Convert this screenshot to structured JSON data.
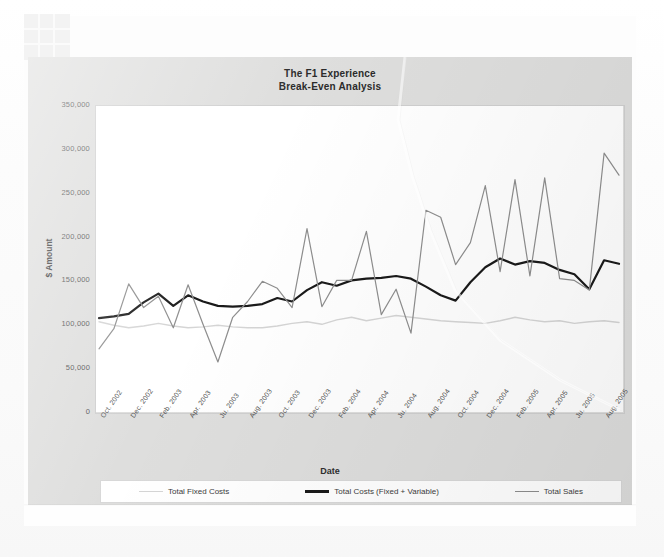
{
  "document": {
    "grid_icon": "spreadsheet-grid-icon"
  },
  "chart": {
    "title_line1": "The F1 Experience",
    "title_line2": "Break-Even Analysis",
    "xlabel": "Date",
    "ylabel": "$ Amount",
    "legend": [
      {
        "label": "Total Fixed Costs",
        "color": "#d5d5d5",
        "width": 1.4
      },
      {
        "label": "Total Costs (Fixed + Variable)",
        "color": "#1a1a1a",
        "width": 2.2
      },
      {
        "label": "Total Sales",
        "color": "#8e8e8e",
        "width": 1.2
      }
    ]
  },
  "chart_data": {
    "type": "line",
    "title": "The F1 Experience Break-Even Analysis",
    "xlabel": "Date",
    "ylabel": "$ Amount",
    "ylim": [
      0,
      350000
    ],
    "yticks": [
      "0",
      "50,000",
      "100,000",
      "150,000",
      "200,000",
      "250,000",
      "300,000",
      "350,000"
    ],
    "ytick_values": [
      0,
      50000,
      100000,
      150000,
      200000,
      250000,
      300000,
      350000
    ],
    "grid": false,
    "legend_position": "bottom",
    "tick_labels": [
      "Oct. 2002",
      "Dec. 2002",
      "Feb. 2003",
      "Apr. 2003",
      "Ju. 2003",
      "Aug. 2003",
      "Oct. 2003",
      "Dec. 2003",
      "Feb. 2004",
      "Apr. 2004",
      "Ju. 2004",
      "Aug. 2004",
      "Oct. 2004",
      "Dec. 2004",
      "Feb. 2005",
      "Apr. 2005",
      "Ju. 2005",
      "Aug. 2005"
    ],
    "x": [
      "Oct. 2002",
      "Nov. 2002",
      "Dec. 2002",
      "Jan. 2003",
      "Feb. 2003",
      "Mar. 2003",
      "Apr. 2003",
      "May 2003",
      "Ju. 2003",
      "Jul. 2003",
      "Aug. 2003",
      "Sep. 2003",
      "Oct. 2003",
      "Nov. 2003",
      "Dec. 2003",
      "Jan. 2004",
      "Feb. 2004",
      "Mar. 2004",
      "Apr. 2004",
      "May 2004",
      "Ju. 2004",
      "Jul. 2004",
      "Aug. 2004",
      "Sep. 2004",
      "Oct. 2004",
      "Nov. 2004",
      "Dec. 2004",
      "Jan. 2005",
      "Feb. 2005",
      "Mar. 2005",
      "Apr. 2005",
      "May 2005",
      "Ju. 2005",
      "Jul. 2005",
      "Aug. 2005",
      "Sep. 2005"
    ],
    "series": [
      {
        "name": "Total Fixed Costs",
        "color": "#d5d5d5",
        "width": 1.4,
        "values": [
          103000,
          99000,
          96000,
          98000,
          101000,
          98000,
          96000,
          97000,
          99000,
          97000,
          96000,
          96000,
          98000,
          101000,
          103000,
          100000,
          105000,
          108000,
          104000,
          107000,
          110000,
          108000,
          106000,
          104000,
          103000,
          102000,
          101000,
          104000,
          108000,
          105000,
          103000,
          104000,
          101000,
          103000,
          104000,
          102000
        ]
      },
      {
        "name": "Total Costs (Fixed + Variable)",
        "color": "#1a1a1a",
        "width": 2.2,
        "values": [
          107000,
          109000,
          112000,
          125000,
          135000,
          121000,
          133000,
          126000,
          121000,
          120000,
          121000,
          123000,
          130000,
          126000,
          139000,
          148000,
          144000,
          150000,
          152000,
          153000,
          155000,
          152000,
          143000,
          133000,
          127000,
          148000,
          165000,
          175000,
          168000,
          172000,
          170000,
          162000,
          157000,
          140000,
          173000,
          169000
        ]
      },
      {
        "name": "Total Sales",
        "color": "#8e8e8e",
        "width": 1.2,
        "values": [
          72000,
          95000,
          146000,
          119000,
          132000,
          96000,
          145000,
          100000,
          57000,
          108000,
          126000,
          149000,
          141000,
          119000,
          209000,
          120000,
          150000,
          150000,
          206000,
          111000,
          140000,
          90000,
          230000,
          222000,
          168000,
          193000,
          258000,
          160000,
          265000,
          155000,
          267000,
          152000,
          150000,
          139000,
          295000,
          270000
        ]
      }
    ]
  }
}
